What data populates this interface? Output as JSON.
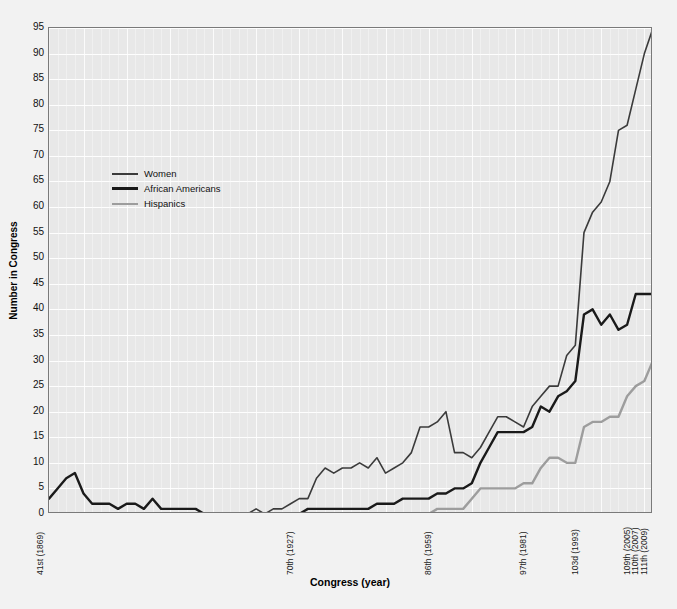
{
  "chart_data": {
    "type": "line",
    "title": "",
    "subtitle": "",
    "xlabel": "Congress (year)",
    "ylabel": "Number in Congress",
    "grid": true,
    "legend_position": "upper-left inside plot",
    "xlim": [
      41,
      111
    ],
    "ylim": [
      0,
      95
    ],
    "yticks": [
      0,
      5,
      10,
      15,
      20,
      25,
      30,
      35,
      40,
      45,
      50,
      55,
      60,
      65,
      70,
      75,
      80,
      85,
      90,
      95
    ],
    "xtick_labels": [
      "41st (1869)",
      "70th (1927)",
      "86th (1959)",
      "97th (1981)",
      "103d (1993)",
      "109th (2005)",
      "110th (2007)",
      "111th (2009)"
    ],
    "xtick_congress": [
      41,
      70,
      86,
      97,
      103,
      109,
      110,
      111
    ],
    "x": [
      41,
      42,
      43,
      44,
      45,
      46,
      47,
      48,
      49,
      50,
      51,
      52,
      53,
      54,
      55,
      56,
      57,
      58,
      59,
      60,
      61,
      62,
      63,
      64,
      65,
      66,
      67,
      68,
      69,
      70,
      71,
      72,
      73,
      74,
      75,
      76,
      77,
      78,
      79,
      80,
      81,
      82,
      83,
      84,
      85,
      86,
      87,
      88,
      89,
      90,
      91,
      92,
      93,
      94,
      95,
      96,
      97,
      98,
      99,
      100,
      101,
      102,
      103,
      104,
      105,
      106,
      107,
      108,
      109,
      110,
      111
    ],
    "series": [
      {
        "name": "Women",
        "color": "#3b3b3b",
        "linewidth": 1.6,
        "values": [
          0,
          0,
          0,
          0,
          0,
          0,
          0,
          0,
          0,
          0,
          0,
          0,
          0,
          0,
          0,
          0,
          0,
          0,
          0,
          0,
          0,
          0,
          0,
          0,
          1,
          0,
          1,
          1,
          2,
          3,
          3,
          7,
          9,
          8,
          9,
          9,
          10,
          9,
          11,
          8,
          9,
          10,
          12,
          17,
          17,
          18,
          20,
          12,
          12,
          11,
          13,
          16,
          19,
          19,
          18,
          17,
          21,
          23,
          25,
          25,
          31,
          33,
          55,
          59,
          61,
          65,
          75,
          76,
          83,
          90,
          95
        ]
      },
      {
        "name": "African Americans",
        "color": "#1a1a1a",
        "linewidth": 2.4,
        "values": [
          3,
          5,
          7,
          8,
          4,
          2,
          2,
          2,
          1,
          2,
          2,
          1,
          3,
          1,
          1,
          1,
          1,
          1,
          0,
          0,
          0,
          0,
          0,
          0,
          0,
          0,
          0,
          0,
          0,
          0,
          1,
          1,
          1,
          1,
          1,
          1,
          1,
          1,
          2,
          2,
          2,
          3,
          3,
          3,
          3,
          4,
          4,
          5,
          5,
          6,
          10,
          13,
          16,
          16,
          16,
          16,
          17,
          21,
          20,
          23,
          24,
          26,
          39,
          40,
          37,
          39,
          36,
          37,
          43,
          43,
          43
        ]
      },
      {
        "name": "Hispanics",
        "color": "#9d9d9d",
        "linewidth": 2.4,
        "values": [
          0,
          0,
          0,
          0,
          0,
          0,
          0,
          0,
          0,
          0,
          0,
          0,
          0,
          0,
          0,
          0,
          0,
          0,
          0,
          0,
          0,
          0,
          0,
          0,
          0,
          0,
          0,
          0,
          0,
          0,
          0,
          0,
          0,
          0,
          0,
          0,
          0,
          0,
          0,
          0,
          0,
          0,
          0,
          0,
          0,
          1,
          1,
          1,
          1,
          3,
          5,
          5,
          5,
          5,
          5,
          6,
          6,
          9,
          11,
          11,
          10,
          10,
          17,
          18,
          18,
          19,
          19,
          23,
          25,
          26,
          30
        ]
      }
    ]
  },
  "legend": {
    "items": [
      {
        "label": "Women",
        "color": "#3b3b3b"
      },
      {
        "label": "African Americans",
        "color": "#1a1a1a"
      },
      {
        "label": "Hispanics",
        "color": "#9d9d9d"
      }
    ]
  },
  "colors": {
    "figure_background": "#f2f2f2",
    "plot_background": "#e8e8e8",
    "grid_major": "#ffffff",
    "axis_frame": "#7a7a7a",
    "text": "#111111"
  }
}
